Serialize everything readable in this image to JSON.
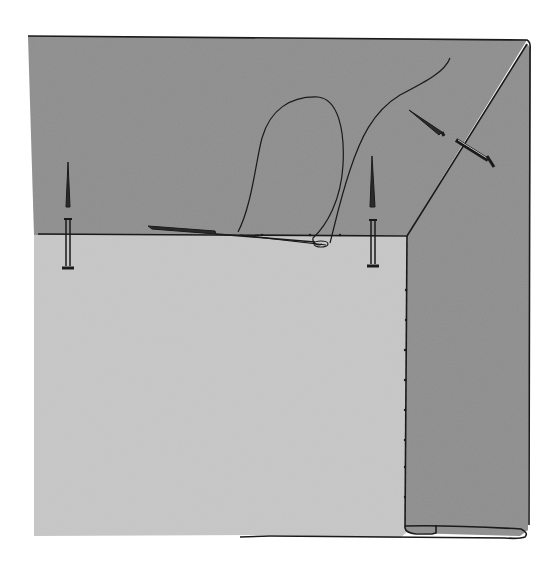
{
  "illustration": {
    "subject": "sewing-hem-corner-with-pins-and-needle",
    "colors": {
      "background": "#ffffff",
      "dark_fabric": "#8c8c8c",
      "light_fabric": "#c4c4c4",
      "outline": "#1a1a1a"
    },
    "elements": {
      "pins": [
        "pin-left",
        "pin-center",
        "pin-diagonal-top",
        "pin-diagonal-fold"
      ],
      "needle": "needle-threaded",
      "thread": "thread-loop"
    }
  }
}
